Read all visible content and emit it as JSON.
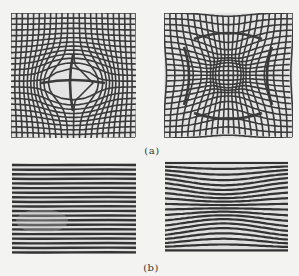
{
  "figure": {
    "subfigures": [
      {
        "id": "a",
        "label": "(a)",
        "panels": [
          {
            "name": "grid-pincushion-center",
            "description": "Square grid distorted with a central circular bulge (barrel-like warp at center)"
          },
          {
            "name": "grid-pincushion-edges",
            "description": "Square grid distorted with outward-bowed curves toward the four edges"
          }
        ]
      },
      {
        "id": "b",
        "label": "(b)",
        "panels": [
          {
            "name": "stripes-straight",
            "description": "Horizontal fringe stripes, nearly straight"
          },
          {
            "name": "stripes-wavy",
            "description": "Horizontal fringe stripes with wavy distortion"
          }
        ]
      }
    ],
    "colors": {
      "background": "#f3f3f1",
      "line_dark": "#3a3a3a",
      "line_light": "#d8d8d8"
    }
  }
}
